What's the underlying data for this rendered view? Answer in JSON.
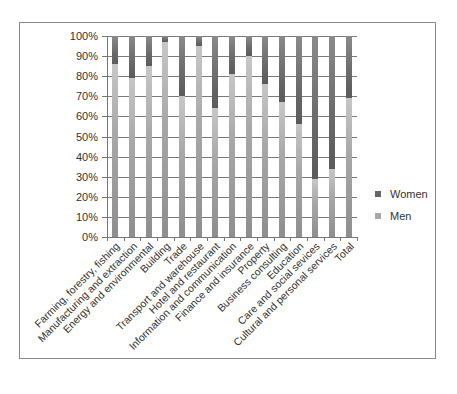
{
  "chart_data": {
    "type": "bar",
    "stacked": true,
    "percent_stacked": true,
    "title": "",
    "xlabel": "",
    "ylabel": "",
    "ylim": [
      0,
      100
    ],
    "y_ticks": [
      "0%",
      "10%",
      "20%",
      "30%",
      "40%",
      "50%",
      "60%",
      "70%",
      "80%",
      "90%",
      "100%"
    ],
    "grid": true,
    "legend_position": "right",
    "categories": [
      "Farming, forestry, fishing",
      "Manufacturing and extraction",
      "Energy and environmental",
      "Building",
      "Trade",
      "Transport and warehouse",
      "Hotel and restaurant",
      "Information and communication",
      "Finance and insurance",
      "Property",
      "Business consulting",
      "Education",
      "Care and social sevices",
      "Cultural and personal services",
      "Total"
    ],
    "series": [
      {
        "name": "Men",
        "color": "#a8a8a8",
        "values": [
          86,
          79,
          85,
          97,
          70,
          95,
          64,
          81,
          90,
          76,
          67,
          56,
          29,
          34,
          69
        ]
      },
      {
        "name": "Women",
        "color": "#666666",
        "values": [
          14,
          21,
          15,
          3,
          30,
          5,
          36,
          19,
          10,
          24,
          33,
          44,
          71,
          66,
          31
        ]
      }
    ]
  },
  "legend": {
    "items": [
      {
        "label": "Women",
        "color": "#666666"
      },
      {
        "label": "Men",
        "color": "#a8a8a8"
      }
    ]
  }
}
